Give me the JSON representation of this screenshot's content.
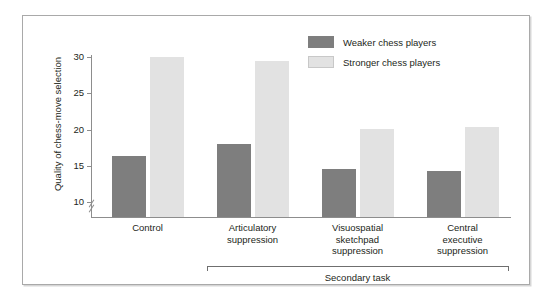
{
  "chart_data": {
    "type": "bar",
    "title": "",
    "xlabel": "Secondary task",
    "ylabel": "Quality of chess-move selection",
    "categories": [
      "Control",
      "Articulatory suppression",
      "Visuospatial sketchpad suppression",
      "Central executive suppression"
    ],
    "series": [
      {
        "name": "Weaker chess players",
        "color": "#7e7e7e",
        "values": [
          16.4,
          18.1,
          14.6,
          14.3
        ]
      },
      {
        "name": "Stronger chess players",
        "color": "#e2e2e2",
        "values": [
          30.0,
          29.5,
          20.1,
          20.4
        ]
      }
    ],
    "ylim": [
      8,
      30
    ],
    "yticks": [
      10,
      15,
      20,
      25,
      30
    ],
    "ytick_labels": [
      "10",
      "15",
      "20",
      "25",
      "30"
    ],
    "axis_break": true,
    "grid": false,
    "legend_position": "top-right",
    "annotations": [
      {
        "text": "Secondary task",
        "spans": [
          "Articulatory suppression",
          "Visuospatial sketchpad suppression",
          "Central executive suppression"
        ]
      }
    ]
  },
  "axis": {
    "y_title": "Quality of chess-move selection",
    "ticks": [
      {
        "label": "30",
        "value": 30
      },
      {
        "label": "25",
        "value": 25
      },
      {
        "label": "20",
        "value": 20
      },
      {
        "label": "15",
        "value": 15
      },
      {
        "label": "10",
        "value": 10
      }
    ]
  },
  "groups": [
    {
      "lines": [
        "Control"
      ]
    },
    {
      "lines": [
        "Articulatory",
        "suppression"
      ]
    },
    {
      "lines": [
        "Visuospatial",
        "sketchpad",
        "suppression"
      ]
    },
    {
      "lines": [
        "Central",
        "executive",
        "suppression"
      ]
    }
  ],
  "bracket": {
    "label": "Secondary task"
  },
  "legend": {
    "items": [
      {
        "label": "Weaker chess players",
        "color": "#7e7e7e"
      },
      {
        "label": "Stronger chess players",
        "color": "#e2e2e2"
      }
    ]
  }
}
